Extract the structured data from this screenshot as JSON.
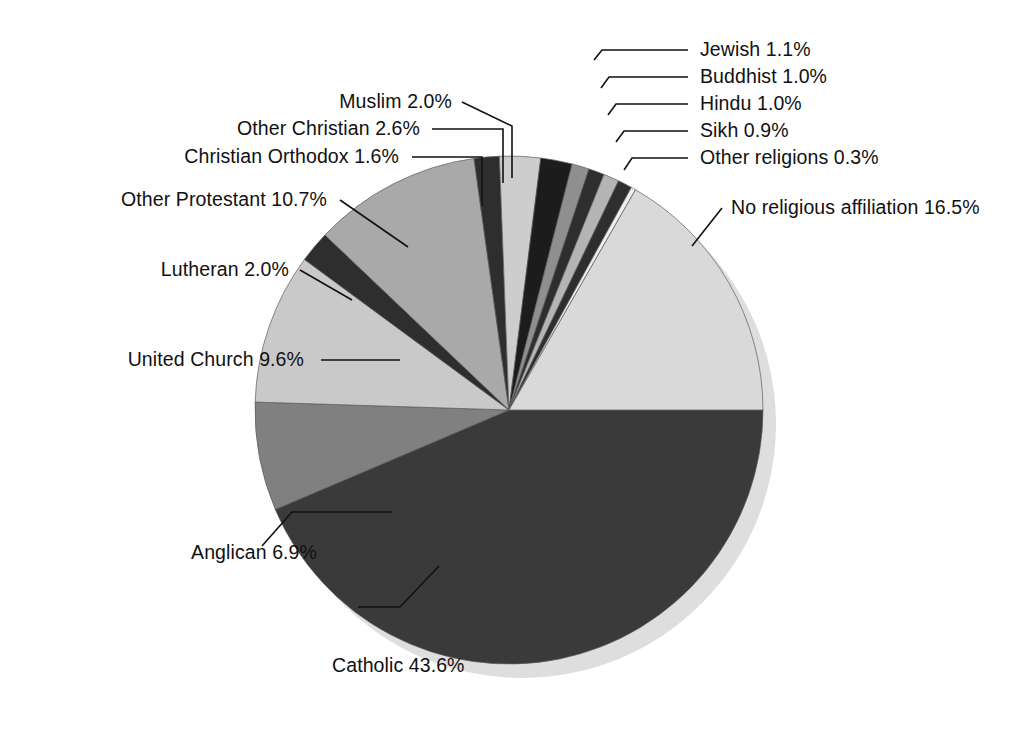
{
  "chart_data": {
    "type": "pie",
    "title": "",
    "subtitle": "",
    "xlabel": "",
    "ylabel": "",
    "legend_position": "none",
    "grid": false,
    "units": "percent",
    "total": 100.0,
    "categories": [
      "Catholic",
      "Anglican",
      "United Church",
      "Lutheran",
      "Other Protestant",
      "Christian Orthodox",
      "Other Christian",
      "Muslim",
      "Jewish",
      "Buddhist",
      "Hindu",
      "Sikh",
      "Other religions",
      "No religious affiliation"
    ],
    "values": [
      43.6,
      6.9,
      9.6,
      2.0,
      10.7,
      1.6,
      2.6,
      2.0,
      1.1,
      1.0,
      1.0,
      0.9,
      0.3,
      16.5
    ],
    "slices": [
      {
        "label": "Catholic",
        "value": 43.6,
        "value_text": "43.6%",
        "label_text": "Catholic 43.6%",
        "color": "#3a3a3a",
        "start_angle": 0,
        "end_angle": 156.96,
        "label_x": 332,
        "label_y": 672,
        "label_anchor": "start",
        "leader": "439 566 L 400 607 L 358 607"
      },
      {
        "label": "Anglican",
        "value": 6.9,
        "value_text": "6.9%",
        "label_text": "Anglican 6.9%",
        "color": "#808080",
        "start_angle": 156.96,
        "end_angle": 181.8,
        "label_x": 317,
        "label_y": 559,
        "label_anchor": "end",
        "leader": "392 512 L 292 512 L 262 546"
      },
      {
        "label": "United Church",
        "value": 9.6,
        "value_text": "9.6%",
        "label_text": "United Church 9.6%",
        "color": "#c9c9c9",
        "start_angle": 181.8,
        "end_angle": 216.36,
        "label_x": 304,
        "label_y": 366,
        "label_anchor": "end",
        "leader": "321 360 L 400 360"
      },
      {
        "label": "Lutheran",
        "value": 2.0,
        "value_text": "2.0%",
        "label_text": "Lutheran 2.0%",
        "color": "#2e2e2e",
        "start_angle": 216.36,
        "end_angle": 223.56,
        "label_x": 289,
        "label_y": 276,
        "label_anchor": "end",
        "leader": "300 270 L 352 300"
      },
      {
        "label": "Other Protestant",
        "value": 10.7,
        "value_text": "10.7%",
        "label_text": "Other Protestant 10.7%",
        "color": "#a9a9a9",
        "start_angle": 223.56,
        "end_angle": 262.08,
        "label_x": 327,
        "label_y": 206,
        "label_anchor": "end",
        "leader": "340 200 L 408 247"
      },
      {
        "label": "Christian Orthodox",
        "value": 1.6,
        "value_text": "1.6%",
        "label_text": "Christian Orthodox 1.6%",
        "color": "#2e2e2e",
        "start_angle": 262.08,
        "end_angle": 267.84,
        "label_x": 399,
        "label_y": 163,
        "label_anchor": "end",
        "leader": "412 157 L 482 157 L 482 206"
      },
      {
        "label": "Other Christian",
        "value": 2.6,
        "value_text": "2.6%",
        "label_text": "Other Christian 2.6%",
        "color": "#cdcdcd",
        "start_angle": 267.84,
        "end_angle": 277.2,
        "label_x": 420,
        "label_y": 135,
        "label_anchor": "end",
        "leader": "432 129 L 503 129 L 503 183"
      },
      {
        "label": "Muslim",
        "value": 2.0,
        "value_text": "2.0%",
        "label_text": "Muslim 2.0%",
        "color": "#1c1c1c",
        "start_angle": 277.2,
        "end_angle": 284.4,
        "label_x": 452,
        "label_y": 108,
        "label_anchor": "end",
        "leader": "462 102 L 512 126 L 512 178"
      },
      {
        "label": "Jewish",
        "value": 1.1,
        "value_text": "1.1%",
        "label_text": "Jewish 1.1%",
        "color": "#8f8f8f",
        "start_angle": 284.4,
        "end_angle": 288.36,
        "label_x": 700,
        "label_y": 56,
        "label_anchor": "start",
        "leader": "688 50 L 602 50 L 594 60"
      },
      {
        "label": "Buddhist",
        "value": 1.0,
        "value_text": "1.0%",
        "label_text": "Buddhist 1.0%",
        "color": "#2e2e2e",
        "start_angle": 288.36,
        "end_angle": 291.96,
        "label_x": 700,
        "label_y": 83,
        "label_anchor": "start",
        "leader": "688 77 L 609 77 L 601 88"
      },
      {
        "label": "Hindu",
        "value": 1.0,
        "value_text": "1.0%",
        "label_text": "Hindu 1.0%",
        "color": "#b4b4b4",
        "start_angle": 291.96,
        "end_angle": 295.56,
        "label_x": 700,
        "label_y": 110,
        "label_anchor": "start",
        "leader": "688 104 L 616 104 L 608 115"
      },
      {
        "label": "Sikh",
        "value": 0.9,
        "value_text": "0.9%",
        "label_text": "Sikh 0.9%",
        "color": "#2e2e2e",
        "start_angle": 295.56,
        "end_angle": 298.8,
        "label_x": 700,
        "label_y": 137,
        "label_anchor": "start",
        "leader": "688 131 L 624 131 L 616 142"
      },
      {
        "label": "Other religions",
        "value": 0.3,
        "value_text": "0.3%",
        "label_text": "Other religions 0.3%",
        "color": "#efefef",
        "start_angle": 298.8,
        "end_angle": 299.88,
        "label_x": 700,
        "label_y": 164,
        "label_anchor": "start",
        "leader": "688 158 L 632 158 L 624 170"
      },
      {
        "label": "No religious affiliation",
        "value": 16.5,
        "value_text": "16.5%",
        "label_text": "No religious affiliation 16.5%",
        "color": "#d9d9d9",
        "start_angle": 299.88,
        "end_angle": 360,
        "label_x": 731,
        "label_y": 214,
        "label_anchor": "start",
        "leader": "722 208 L 692 246"
      }
    ],
    "geometry": {
      "center_x": 509,
      "center_y": 410,
      "radius": 254,
      "shadow_offset_x": 13,
      "shadow_offset_y": 14,
      "shadow_color": "#dedede",
      "background_color": "#ffffff",
      "slice_outline_color": "#5a5a5a",
      "leader_color": "#111111",
      "text_color": "#111111"
    }
  }
}
